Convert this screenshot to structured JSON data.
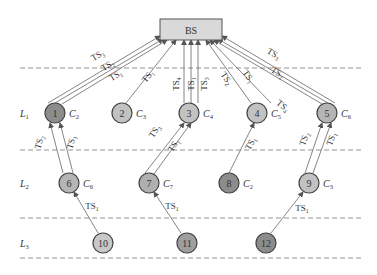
{
  "diagram": {
    "base_station": {
      "label": "BS",
      "x": 160,
      "y": 19,
      "w": 62,
      "h": 21,
      "fill": "#d9d9d9"
    },
    "dashed_lines_y": [
      68,
      150,
      218,
      258
    ],
    "layers": [
      {
        "label": "L",
        "sub": "1",
        "y": 113
      },
      {
        "label": "L",
        "sub": "2",
        "y": 183
      },
      {
        "label": "L",
        "sub": "3",
        "y": 243
      }
    ],
    "nodes": [
      {
        "id": "1",
        "x": 55,
        "y": 113,
        "fill": "#8c8c8c",
        "channel": "C",
        "channel_sub": "2"
      },
      {
        "id": "2",
        "x": 122,
        "y": 113,
        "fill": "#c2c2c2",
        "channel": "C",
        "channel_sub": "3"
      },
      {
        "id": "3",
        "x": 189,
        "y": 113,
        "fill": "#c2c2c2",
        "channel": "C",
        "channel_sub": "4"
      },
      {
        "id": "4",
        "x": 257,
        "y": 113,
        "fill": "#c2c2c2",
        "channel": "C",
        "channel_sub": "5"
      },
      {
        "id": "5",
        "x": 327,
        "y": 113,
        "fill": "#b5b5b5",
        "channel": "C",
        "channel_sub": "6"
      },
      {
        "id": "6",
        "x": 69,
        "y": 183,
        "fill": "#b5b5b5",
        "channel": "C",
        "channel_sub": "6"
      },
      {
        "id": "7",
        "x": 149,
        "y": 183,
        "fill": "#b0b0b0",
        "channel": "C",
        "channel_sub": "7"
      },
      {
        "id": "8",
        "x": 229,
        "y": 183,
        "fill": "#8c8c8c",
        "channel": "C",
        "channel_sub": "2"
      },
      {
        "id": "9",
        "x": 309,
        "y": 183,
        "fill": "#c2c2c2",
        "channel": "C",
        "channel_sub": "3"
      },
      {
        "id": "10",
        "x": 103,
        "y": 243,
        "fill": "#c8c8c8",
        "channel": "",
        "channel_sub": ""
      },
      {
        "id": "11",
        "x": 187,
        "y": 243,
        "fill": "#9e9e9e",
        "channel": "",
        "channel_sub": ""
      },
      {
        "id": "12",
        "x": 266,
        "y": 243,
        "fill": "#8c8c8c",
        "channel": "",
        "channel_sub": ""
      }
    ],
    "links": [
      {
        "from": [
          48,
          103
        ],
        "to": [
          160,
          36
        ],
        "label": "TS",
        "sub": "3",
        "lx": 99,
        "ly": 58,
        "rot": -30
      },
      {
        "from": [
          55,
          103
        ],
        "to": [
          163,
          39
        ],
        "label": "TS",
        "sub": "2",
        "lx": 109,
        "ly": 68,
        "rot": -30
      },
      {
        "from": [
          62,
          104
        ],
        "to": [
          167,
          40
        ],
        "label": "TS",
        "sub": "1",
        "lx": 117,
        "ly": 78,
        "rot": -30
      },
      {
        "from": [
          126,
          103
        ],
        "to": [
          176,
          40
        ],
        "label": "TS",
        "sub": "1",
        "lx": 150,
        "ly": 78,
        "rot": -50
      },
      {
        "from": [
          184,
          103
        ],
        "to": [
          184,
          40
        ],
        "label": "TS",
        "sub": "4",
        "lx": 179,
        "ly": 84,
        "rot": -90
      },
      {
        "from": [
          191,
          103
        ],
        "to": [
          191,
          40
        ],
        "label": "TS",
        "sub": "1",
        "lx": 194,
        "ly": 84,
        "rot": -90
      },
      {
        "from": [
          198,
          103
        ],
        "to": [
          198,
          40
        ],
        "label": "TS",
        "sub": "3",
        "lx": 207,
        "ly": 84,
        "rot": -90
      },
      {
        "from": [
          251,
          103
        ],
        "to": [
          206,
          40
        ],
        "label": "TS",
        "sub": "2",
        "lx": 224,
        "ly": 80,
        "rot": 55
      },
      {
        "from": [
          322,
          104
        ],
        "to": [
          214,
          40
        ],
        "label": "TS",
        "sub": "4",
        "lx": 281,
        "ly": 108,
        "rot": 40
      },
      {
        "from": [
          328,
          103
        ],
        "to": [
          218,
          39
        ],
        "label": "TS",
        "sub": "2",
        "lx": 276,
        "ly": 75,
        "rot": 30
      },
      {
        "from": [
          335,
          103
        ],
        "to": [
          222,
          36
        ],
        "label": "TS",
        "sub": "3",
        "lx": 272,
        "ly": 56,
        "rot": 30
      },
      {
        "from": [
          271,
          103
        ],
        "to": [
          210,
          40
        ],
        "label": "TS",
        "sub": "1",
        "lx": 246,
        "ly": 78,
        "rot": 55
      },
      {
        "from": [
          63,
          173
        ],
        "to": [
          50,
          123
        ],
        "label": "TS",
        "sub": "2",
        "lx": 42,
        "ly": 143,
        "rot": -75
      },
      {
        "from": [
          73,
          173
        ],
        "to": [
          60,
          123
        ],
        "label": "TS",
        "sub": "1",
        "lx": 74,
        "ly": 143,
        "rot": -75
      },
      {
        "from": [
          145,
          173
        ],
        "to": [
          184,
          123
        ],
        "label": "TS",
        "sub": "3",
        "lx": 157,
        "ly": 133,
        "rot": -55
      },
      {
        "from": [
          154,
          174
        ],
        "to": [
          191,
          123
        ],
        "label": "TS",
        "sub": "1",
        "lx": 176,
        "ly": 147,
        "rot": -55
      },
      {
        "from": [
          229,
          173
        ],
        "to": [
          254,
          123
        ],
        "label": "TS",
        "sub": "1",
        "lx": 253,
        "ly": 145,
        "rot": -60
      },
      {
        "from": [
          305,
          173
        ],
        "to": [
          322,
          123
        ],
        "label": "TS",
        "sub": "2",
        "lx": 307,
        "ly": 140,
        "rot": -70
      },
      {
        "from": [
          313,
          173
        ],
        "to": [
          331,
          123
        ],
        "label": "TS",
        "sub": "1",
        "lx": 334,
        "ly": 140,
        "rot": -70
      },
      {
        "from": [
          98,
          233
        ],
        "to": [
          74,
          192
        ],
        "label": "TS",
        "sub": "1",
        "lx": 92,
        "ly": 209,
        "rot": 0
      },
      {
        "from": [
          181,
          233
        ],
        "to": [
          154,
          192
        ],
        "label": "TS",
        "sub": "1",
        "lx": 172,
        "ly": 209,
        "rot": 0
      },
      {
        "from": [
          271,
          233
        ],
        "to": [
          303,
          192
        ],
        "label": "TS",
        "sub": "1",
        "lx": 302,
        "ly": 211,
        "rot": 0
      }
    ]
  }
}
